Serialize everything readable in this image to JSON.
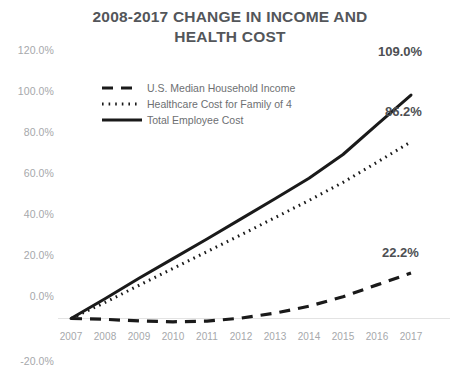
{
  "chart_data": {
    "type": "line",
    "title": "2008-2017 CHANGE IN INCOME AND HEALTH COST",
    "title_line1": "2008-2017 CHANGE IN INCOME AND",
    "title_line2": "HEALTH COST",
    "xlabel": "",
    "ylabel": "",
    "grid": false,
    "legend_position": "upper-left-inside",
    "ylim": [
      -20.0,
      120.0
    ],
    "ytick_labels": [
      "120.0%",
      "100.0%",
      "80.0%",
      "60.0%",
      "40.0%",
      "20.0%",
      "0.0%",
      "-20.0%"
    ],
    "ytick_values": [
      120.0,
      100.0,
      80.0,
      60.0,
      40.0,
      20.0,
      0.0,
      -20.0
    ],
    "categories": [
      "2007",
      "2008",
      "2009",
      "2010",
      "2011",
      "2012",
      "2013",
      "2014",
      "2015",
      "2016",
      "2017"
    ],
    "x": [
      2007,
      2008,
      2009,
      2010,
      2011,
      2012,
      2013,
      2014,
      2015,
      2016,
      2017
    ],
    "series": [
      {
        "name": "U.S. Median Household Income",
        "style": "dashed",
        "color": "#1a1a1a",
        "values": [
          0.0,
          -0.4,
          -1.2,
          -1.6,
          -1.3,
          0.2,
          2.6,
          6.0,
          10.6,
          16.4,
          22.2
        ],
        "end_label": "22.2%"
      },
      {
        "name": "Healthcare Cost for Family of 4",
        "style": "dotted",
        "color": "#1a1a1a",
        "values": [
          0.0,
          7.8,
          16.2,
          24.4,
          32.6,
          40.8,
          49.2,
          57.6,
          66.4,
          76.2,
          86.2
        ],
        "end_label": "86.2%"
      },
      {
        "name": "Total Employee Cost",
        "style": "solid",
        "color": "#1a1a1a",
        "values": [
          0.0,
          9.6,
          19.6,
          29.2,
          38.8,
          48.6,
          58.4,
          68.4,
          80.0,
          94.6,
          109.0
        ],
        "end_label": "109.0%"
      }
    ],
    "end_labels": [
      "109.0%",
      "86.2%",
      "22.2%"
    ],
    "colors": {
      "axis_text": "#a6a8ab",
      "title_text": "#53565a",
      "legend_text": "#6d6f72",
      "data_label_text": "#4d4f53",
      "line": "#1a1a1a",
      "baseline": "#e3e3e3",
      "background": "#ffffff"
    }
  }
}
